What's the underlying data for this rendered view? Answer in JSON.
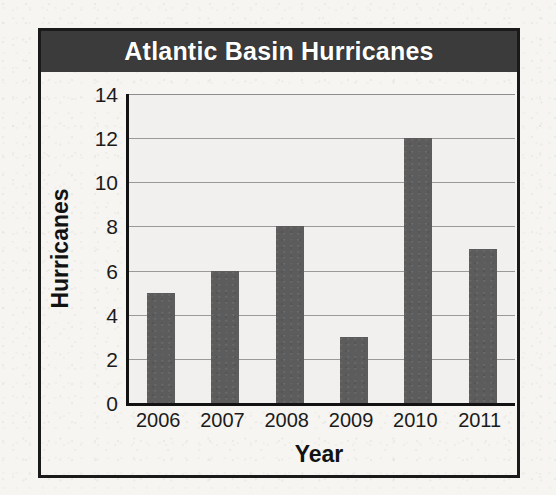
{
  "chart_data": {
    "type": "bar",
    "title": "Atlantic Basin Hurricanes",
    "xlabel": "Year",
    "ylabel": "Hurricanes",
    "categories": [
      "2006",
      "2007",
      "2008",
      "2009",
      "2010",
      "2011"
    ],
    "values": [
      5,
      6,
      8,
      3,
      12,
      7
    ],
    "ylim": [
      0,
      14
    ],
    "yticks": [
      0,
      2,
      4,
      6,
      8,
      10,
      12,
      14
    ],
    "ytick_labels": [
      "0",
      "2",
      "4",
      "6",
      "8",
      "10",
      "12",
      "14"
    ],
    "grid": true,
    "legend": false,
    "legend_position": "none",
    "colors": {
      "bar": "#5c5c5c",
      "title_bar_background": "#3b3b3b",
      "title_text": "#ffffff",
      "plot_background": "#f1f0ee",
      "gridline": "#9a9a9a",
      "axis_line": "#121212",
      "frame": "#1a1a1a",
      "page_background": "#f6f5f2"
    }
  }
}
